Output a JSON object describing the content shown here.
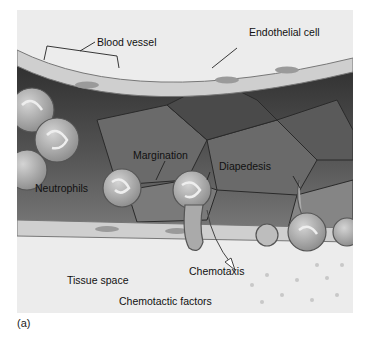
{
  "figure": {
    "panel_label": "(a)",
    "labels": {
      "blood_vessel": "Blood vessel",
      "endothelial_cell": "Endothelial cell",
      "margination": "Margination",
      "diapedesis": "Diapedesis",
      "neutrophils": "Neutrophils",
      "chemotaxis": "Chemotaxis",
      "tissue_space": "Tissue space",
      "chemotactic_factors": "Chemotactic factors"
    },
    "colors": {
      "background": "#ececec",
      "vessel_lumen_dark": "#3a3a3a",
      "vessel_lumen_mid": "#6e6e6e",
      "endothelium": "#c9c9c9",
      "neutrophil": "#a9a9a9"
    }
  }
}
